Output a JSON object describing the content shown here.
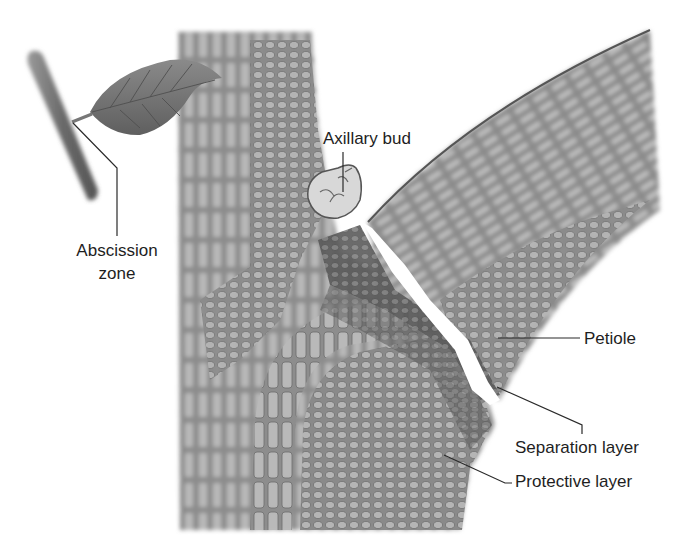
{
  "figure": {
    "type": "botanical-illustration",
    "background_color": "#ffffff",
    "tissue_color": "#8a8a8a",
    "dark_tissue_color": "#5e5e5e",
    "leader_line_color": "#2a2a2a"
  },
  "labels": {
    "abscission_zone": {
      "line1": "Abscission",
      "line2": "zone"
    },
    "axillary_bud": "Axillary bud",
    "petiole": "Petiole",
    "separation_layer": "Separation layer",
    "protective_layer": "Protective layer"
  },
  "inset": {
    "elements": [
      "twig",
      "leaf"
    ]
  }
}
